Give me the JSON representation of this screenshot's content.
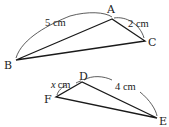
{
  "diagram": {
    "type": "similar-triangles",
    "triangle_1": {
      "vertices": {
        "A": {
          "label": "A",
          "x": 112,
          "y": 19
        },
        "B": {
          "label": "B",
          "x": 16,
          "y": 60
        },
        "C": {
          "label": "C",
          "x": 145,
          "y": 41
        }
      },
      "measurements": {
        "AB": {
          "value": "5",
          "unit": "cm",
          "text": "5 cm"
        },
        "AC": {
          "value": "2",
          "unit": "cm",
          "text": "2 cm"
        }
      }
    },
    "triangle_2": {
      "vertices": {
        "D": {
          "label": "D",
          "x": 82,
          "y": 82
        },
        "E": {
          "label": "E",
          "x": 157,
          "y": 118
        },
        "F": {
          "label": "F",
          "x": 56,
          "y": 97
        }
      },
      "measurements": {
        "DF": {
          "variable": "x",
          "unit": "cm",
          "text": "x cm"
        },
        "DE": {
          "value": "4",
          "unit": "cm",
          "text": "4 cm"
        }
      }
    },
    "colors": {
      "line": "#1a1a1a",
      "text": "#222222",
      "background": "#ffffff"
    }
  }
}
